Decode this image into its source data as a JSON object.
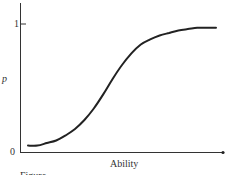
{
  "chart_data": {
    "type": "line",
    "title": "",
    "xlabel": "Ability",
    "ylabel": "p",
    "yticks": [
      "0",
      "1"
    ],
    "ylim": [
      0,
      1
    ],
    "grid": false,
    "legend": null,
    "series": [
      {
        "name": "item characteristic curve",
        "x": [
          0.0,
          0.05,
          0.1,
          0.15,
          0.2,
          0.25,
          0.3,
          0.35,
          0.4,
          0.45,
          0.5,
          0.55,
          0.6,
          0.65,
          0.7,
          0.75,
          0.8,
          0.85,
          0.9,
          0.95,
          1.0
        ],
        "values": [
          0.05,
          0.05,
          0.07,
          0.09,
          0.13,
          0.18,
          0.25,
          0.34,
          0.45,
          0.57,
          0.68,
          0.77,
          0.84,
          0.88,
          0.91,
          0.93,
          0.95,
          0.96,
          0.97,
          0.97,
          0.97
        ]
      }
    ]
  },
  "labels": {
    "y_axis": "p",
    "y_tick_top": "1",
    "y_tick_bottom": "0",
    "x_axis": "Ability",
    "caption_partial": "Figure"
  }
}
